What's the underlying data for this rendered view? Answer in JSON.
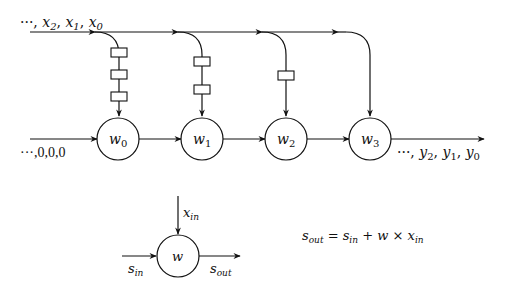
{
  "diagram": {
    "input_x_label": "···, x₂, x₁, x₀",
    "input_x": {
      "prefix": "···, ",
      "terms": [
        "x",
        "x",
        "x"
      ],
      "subs": [
        "2",
        "1",
        "0"
      ]
    },
    "input_s_label": "···,0,0,0",
    "output_y": {
      "prefix": "···, ",
      "terms": [
        "y",
        "y",
        "y"
      ],
      "subs": [
        "2",
        "1",
        "0"
      ]
    },
    "output_y_label": "···, y₂, y₁, y₀",
    "cells": [
      {
        "name": "w",
        "sub": "0",
        "delays": 3
      },
      {
        "name": "w",
        "sub": "1",
        "delays": 2
      },
      {
        "name": "w",
        "sub": "2",
        "delays": 1
      },
      {
        "name": "w",
        "sub": "3",
        "delays": 0
      }
    ],
    "cell_detail": {
      "name": "w",
      "x_in": {
        "base": "x",
        "sub": "in"
      },
      "s_in": {
        "base": "s",
        "sub": "in"
      },
      "s_out": {
        "base": "s",
        "sub": "out"
      }
    },
    "equation": {
      "text": "s_out = s_in + w × x_in",
      "lhs": {
        "base": "s",
        "sub": "out"
      },
      "eq": " = ",
      "t1": {
        "base": "s",
        "sub": "in"
      },
      "plus": " + ",
      "w": "w",
      "times": " × ",
      "t2": {
        "base": "x",
        "sub": "in"
      }
    },
    "colors": {
      "stroke": "#111111",
      "background": "#ffffff"
    }
  }
}
